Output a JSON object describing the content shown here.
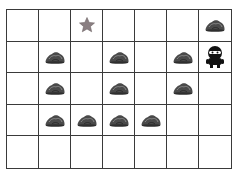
{
  "grid": {
    "columns": 7,
    "rows": 5,
    "line_color": "#3a3a3a",
    "cells": [
      [
        "empty",
        "empty",
        "star",
        "empty",
        "empty",
        "empty",
        "rock"
      ],
      [
        "empty",
        "rock",
        "empty",
        "rock",
        "empty",
        "rock",
        "agent"
      ],
      [
        "empty",
        "rock",
        "empty",
        "rock",
        "empty",
        "rock",
        "empty"
      ],
      [
        "empty",
        "rock",
        "rock",
        "rock",
        "rock",
        "empty",
        "empty"
      ],
      [
        "empty",
        "empty",
        "empty",
        "empty",
        "empty",
        "empty",
        "empty"
      ]
    ]
  },
  "icons": {
    "star": {
      "name": "star-icon",
      "color": "#8a7f82"
    },
    "rock": {
      "name": "rock-icon",
      "color": "#4a4a4a"
    },
    "agent": {
      "name": "robot-agent-icon",
      "color": "#111111"
    }
  }
}
